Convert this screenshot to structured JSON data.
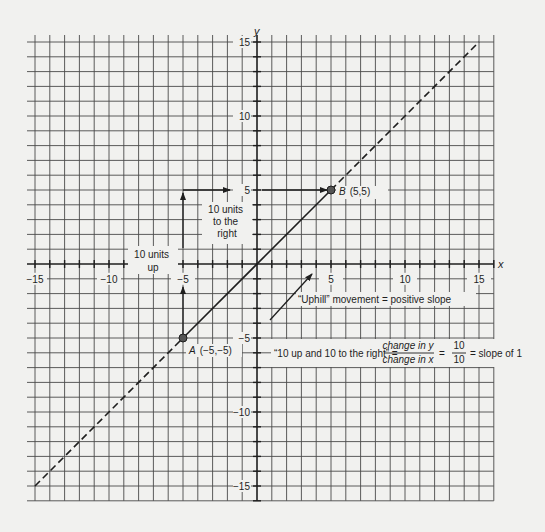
{
  "chart_data": {
    "type": "line",
    "title": "",
    "xlabel": "x",
    "ylabel": "y",
    "xlim": [
      -15,
      16
    ],
    "ylim": [
      -16,
      15
    ],
    "grid": true,
    "x_ticks": [
      -15,
      -10,
      -5,
      5,
      10,
      15
    ],
    "y_ticks": [
      15,
      10,
      5,
      -5,
      -10,
      -15
    ],
    "x_tick_labels": [
      "−15",
      "−10",
      "−5",
      "5",
      "10",
      "15"
    ],
    "y_tick_labels": [
      "15",
      "10",
      "5",
      "−5",
      "−10",
      "−15"
    ],
    "series": [
      {
        "name": "y = x",
        "equation": "y = x",
        "slope": 1,
        "solid_segment": {
          "x": [
            -5,
            5
          ],
          "y": [
            -5,
            5
          ]
        },
        "dashed_segments": [
          {
            "x": [
              -15,
              -5
            ],
            "y": [
              -15,
              -5
            ]
          },
          {
            "x": [
              5,
              15
            ],
            "y": [
              5,
              15
            ]
          }
        ]
      }
    ],
    "points": [
      {
        "id": "A",
        "label": "A",
        "coords_label": "(−5,−5)",
        "x": -5,
        "y": -5
      },
      {
        "id": "B",
        "label": "B",
        "coords_label": "(5,5)",
        "x": 5,
        "y": 5
      }
    ],
    "annotations": [
      {
        "id": "up",
        "text_lines": [
          "10 units",
          "up"
        ]
      },
      {
        "id": "right",
        "text_lines": [
          "10 units",
          "to the",
          "right"
        ]
      },
      {
        "id": "uphill",
        "text": "“Uphill” movement = positive slope"
      },
      {
        "id": "equation",
        "prefix": "“10 up and 10 to the right” =",
        "fraction_num": "change in y",
        "fraction_den": "change in x",
        "equals1": "=",
        "value_num": "10",
        "value_den": "10",
        "suffix": "= slope of 1"
      }
    ]
  },
  "colors": {
    "background": "#f1f1ef",
    "grid": "#4a4a4a",
    "axis": "#1e1e1e",
    "point_fill": "#555555"
  }
}
